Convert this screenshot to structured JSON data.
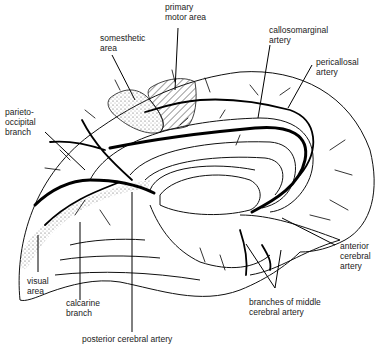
{
  "diagram": {
    "labels": {
      "primary_motor_area": "primary\nmotor area",
      "somesthetic_area": "somesthetic\narea",
      "callosomarginal_artery": "callosomarginal\nartery",
      "pericallosal_artery": "pericallosal\nartery",
      "parieto_occipital_branch": "parieto-\noccipital\nbranch",
      "visual_area": "visual\narea",
      "calcarine_branch": "calcarine\nbranch",
      "anterior_cerebral_artery": "anterior\ncerebral\nartery",
      "branches_of_middle_cerebral_artery": "branches of middle\ncerebral artery",
      "posterior_cerebral_artery": "posterior cerebral artery"
    },
    "colors": {
      "ink": "#000000",
      "background": "#ffffff"
    }
  }
}
